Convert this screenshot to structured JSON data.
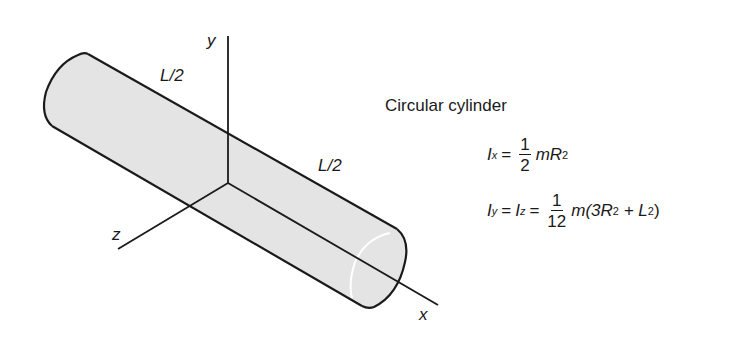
{
  "figure": {
    "title": "Circular cylinder",
    "axes": {
      "x": "x",
      "y": "y",
      "z": "z"
    },
    "segment_labels": {
      "left_half": "L/2",
      "right_half": "L/2"
    },
    "colors": {
      "cylinder_fill": "#e4e4e4",
      "stroke": "#1a1a1a",
      "background": "#ffffff"
    },
    "equations": {
      "ix": {
        "lhs_symbol": "I",
        "lhs_sub": "x",
        "eq": "=",
        "frac_num": "1",
        "frac_den": "2",
        "rhs_m": "mR",
        "rhs_sup": "2"
      },
      "iyz": {
        "lhs1_symbol": "I",
        "lhs1_sub": "y",
        "eq1": "=",
        "lhs2_symbol": "I",
        "lhs2_sub": "z",
        "eq2": "=",
        "frac_num": "1",
        "frac_den": "12",
        "rhs_a": "m(3R",
        "rhs_sup1": "2",
        "rhs_b": " + L",
        "rhs_sup2": "2",
        "rhs_c": ")"
      }
    }
  }
}
